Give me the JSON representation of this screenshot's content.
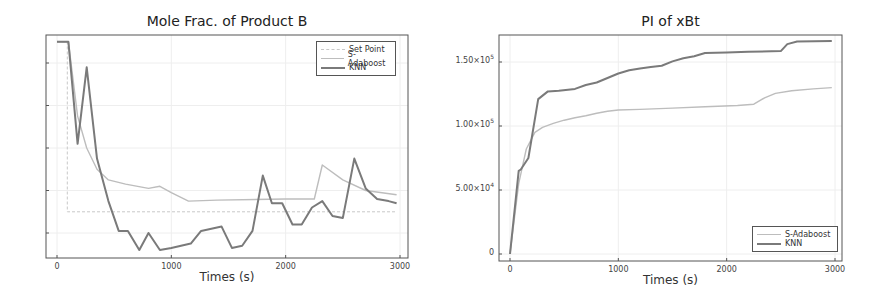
{
  "chart_data": [
    {
      "type": "line",
      "title": "Mole Frac. of Product B",
      "xlabel": "Times (s)",
      "ylabel": "",
      "xlim": [
        -100,
        3070
      ],
      "ylim": [
        0.008,
        0.114
      ],
      "xticks": [
        "0",
        "1000",
        "2000",
        "3000"
      ],
      "yticks": [
        "0.02",
        "0.04",
        "0.06",
        "0.08",
        "0.10"
      ],
      "grid": true,
      "legend_position": "upper right",
      "series": [
        {
          "name": "Set Point",
          "color": "#c8c8c8",
          "width": 1,
          "dash": "3,2",
          "x": [
            0,
            90,
            90,
            2970
          ],
          "y": [
            0.11,
            0.11,
            0.03,
            0.03
          ]
        },
        {
          "name": "S-Adaboost",
          "color": "#bdbdbd",
          "width": 1.4,
          "dash": "",
          "x": [
            0,
            100,
            180,
            260,
            350,
            450,
            600,
            800,
            900,
            1000,
            1150,
            1400,
            2000,
            2250,
            2320,
            2500,
            2700,
            2970
          ],
          "y": [
            0.11,
            0.11,
            0.075,
            0.06,
            0.05,
            0.045,
            0.043,
            0.041,
            0.042,
            0.039,
            0.035,
            0.0355,
            0.036,
            0.036,
            0.052,
            0.045,
            0.04,
            0.038
          ]
        },
        {
          "name": "KNN",
          "color": "#7a7a7a",
          "width": 2,
          "dash": "",
          "x": [
            0,
            100,
            180,
            260,
            350,
            450,
            540,
            620,
            720,
            800,
            900,
            1000,
            1170,
            1260,
            1440,
            1530,
            1620,
            1710,
            1800,
            1880,
            1970,
            2060,
            2140,
            2230,
            2320,
            2410,
            2500,
            2600,
            2700,
            2800,
            2900,
            2970
          ],
          "y": [
            0.11,
            0.11,
            0.062,
            0.098,
            0.055,
            0.035,
            0.021,
            0.021,
            0.012,
            0.02,
            0.012,
            0.013,
            0.015,
            0.021,
            0.023,
            0.013,
            0.014,
            0.021,
            0.047,
            0.034,
            0.034,
            0.024,
            0.024,
            0.032,
            0.035,
            0.028,
            0.027,
            0.055,
            0.041,
            0.036,
            0.035,
            0.034
          ]
        }
      ]
    },
    {
      "type": "line",
      "title": "PI of xBt",
      "xlabel": "Times (s)",
      "ylabel": "",
      "xlim": [
        -100,
        3070
      ],
      "ylim": [
        -5500,
        171000
      ],
      "xticks": [
        "0",
        "1000",
        "2000",
        "3000"
      ],
      "yticks": [
        "0",
        "5.00×10^4",
        "1.00×10^5",
        "1.50×10^5"
      ],
      "grid": true,
      "legend_position": "lower right",
      "series": [
        {
          "name": "S-Adaboost",
          "color": "#bdbdbd",
          "width": 1.4,
          "x": [
            0,
            80,
            150,
            230,
            300,
            400,
            500,
            600,
            700,
            800,
            900,
            1000,
            1200,
            1500,
            1800,
            2100,
            2250,
            2350,
            2450,
            2600,
            2800,
            2970
          ],
          "y": [
            0,
            55000,
            82000,
            95000,
            99000,
            102000,
            104500,
            106500,
            108000,
            110000,
            111500,
            112500,
            113000,
            114000,
            115000,
            116000,
            117000,
            122000,
            125500,
            127500,
            129000,
            130000
          ]
        },
        {
          "name": "KNN",
          "color": "#7a7a7a",
          "width": 2,
          "x": [
            0,
            80,
            100,
            170,
            260,
            350,
            450,
            600,
            700,
            800,
            900,
            1000,
            1100,
            1200,
            1300,
            1400,
            1500,
            1600,
            1700,
            1800,
            2000,
            2200,
            2500,
            2560,
            2650,
            2970
          ],
          "y": [
            0,
            65000,
            66000,
            75000,
            121000,
            127000,
            127500,
            129000,
            132000,
            134000,
            137500,
            141000,
            143500,
            145000,
            146000,
            147000,
            150500,
            153000,
            154500,
            157000,
            157500,
            158000,
            158500,
            164000,
            166000,
            166500
          ]
        }
      ]
    }
  ],
  "left": {
    "title": "Mole Frac. of Product B",
    "xlabel": "Times (s)",
    "legend": [
      "Set Point",
      "S-Adaboost",
      "KNN"
    ]
  },
  "right": {
    "title": "PI of xBt",
    "xlabel": "Times (s)",
    "legend": [
      "S-Adaboost",
      "KNN"
    ]
  }
}
